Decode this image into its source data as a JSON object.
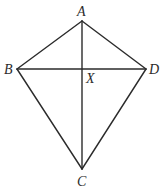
{
  "figure": {
    "type": "kite",
    "stroke_color": "#2b2b2b",
    "background": "#ffffff",
    "vertices": {
      "A": {
        "label": "A",
        "x": 82,
        "y": 21
      },
      "B": {
        "label": "B",
        "x": 17,
        "y": 69
      },
      "C": {
        "label": "C",
        "x": 82,
        "y": 169
      },
      "D": {
        "label": "D",
        "x": 146,
        "y": 69
      }
    },
    "intersection": {
      "label": "X",
      "x": 82,
      "y": 69
    },
    "edges": [
      [
        "A",
        "B"
      ],
      [
        "A",
        "D"
      ],
      [
        "B",
        "C"
      ],
      [
        "D",
        "C"
      ]
    ],
    "diagonals": [
      [
        "A",
        "C"
      ],
      [
        "B",
        "D"
      ]
    ],
    "labels": {
      "A": "A",
      "B": "B",
      "C": "C",
      "D": "D",
      "X": "X"
    }
  }
}
